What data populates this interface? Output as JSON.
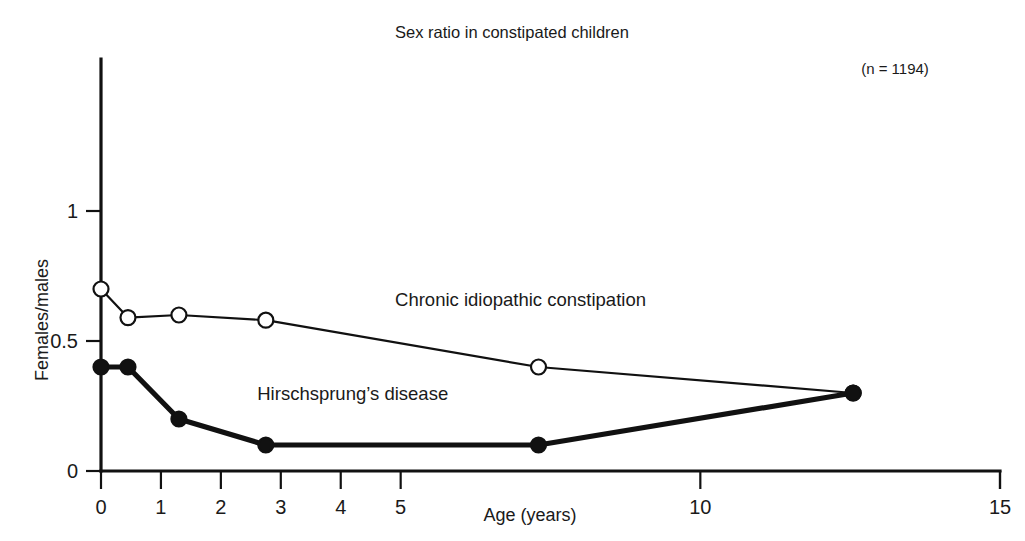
{
  "chart_data": {
    "type": "line",
    "title": "Sex ratio in constipated children",
    "xlabel": "Age (years)",
    "ylabel": "Females/males",
    "annotation": "(n = 1194)",
    "xlim": [
      0,
      15
    ],
    "ylim": [
      0,
      1.3
    ],
    "xticks": [
      0,
      1,
      2,
      3,
      4,
      5,
      10,
      15
    ],
    "xtick_labels": [
      "0",
      "1",
      "2",
      "3",
      "4",
      "5",
      "10",
      "15"
    ],
    "yticks": [
      0,
      0.5,
      1
    ],
    "ytick_labels": [
      "0",
      "0.5",
      "1"
    ],
    "grid": false,
    "legend": "inline-labels",
    "series": [
      {
        "name": "Chronic idiopathic constipation",
        "marker": "open-circle",
        "line_weight": "thin",
        "label_x": 7.0,
        "label_y": 0.635,
        "x": [
          0,
          0.45,
          1.3,
          2.75,
          7.3,
          12.55
        ],
        "y": [
          0.7,
          0.59,
          0.6,
          0.58,
          0.4,
          0.3
        ]
      },
      {
        "name": "Hirschsprung’s disease",
        "marker": "filled-circle",
        "line_weight": "thick",
        "label_x": 4.2,
        "label_y": 0.275,
        "x": [
          0,
          0.45,
          1.3,
          2.75,
          7.3,
          12.55
        ],
        "y": [
          0.4,
          0.4,
          0.2,
          0.1,
          0.1,
          0.3
        ]
      }
    ]
  },
  "colors": {
    "ink": "#111111",
    "background": "#ffffff"
  }
}
